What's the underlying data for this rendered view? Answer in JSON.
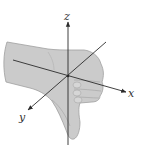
{
  "diagram": {
    "axes": [
      {
        "name": "x",
        "label": "x"
      },
      {
        "name": "y",
        "label": "y"
      },
      {
        "name": "z",
        "label": "z"
      }
    ],
    "colors": {
      "hand_fill": "#c9c9c9",
      "hand_stroke": "#9a9a9a",
      "axis": "#2b2b2b",
      "background": "#ffffff"
    }
  }
}
